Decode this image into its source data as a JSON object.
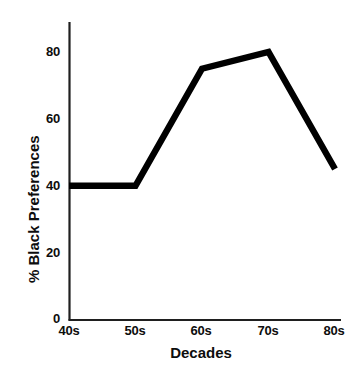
{
  "chart_data": {
    "type": "line",
    "title": "",
    "xlabel": "Decades",
    "ylabel": "% Black Preferences",
    "categories": [
      "40s",
      "50s",
      "60s",
      "70s",
      "80s"
    ],
    "values": [
      40,
      40,
      75,
      80,
      45
    ],
    "series": [
      {
        "name": "% Black Preferences",
        "values": [
          40,
          40,
          75,
          80,
          45
        ]
      }
    ],
    "ylim": [
      0,
      90
    ],
    "yticks": [
      0,
      20,
      40,
      60,
      80
    ],
    "ytick_labels": [
      "0",
      "20",
      "40",
      "60",
      "80"
    ],
    "xtick_labels": [
      "40s",
      "50s",
      "60s",
      "70s",
      "80s"
    ],
    "grid": false,
    "legend": false,
    "legend_position": "none",
    "line_color": "#000000",
    "background_color": "#ffffff",
    "axis_color": "#1a1a1a"
  },
  "axes": {
    "y_label": "% Black Preferences",
    "x_label": "Decades",
    "y_ticks": [
      "80",
      "60",
      "40",
      "20",
      "0"
    ],
    "x_ticks": [
      "40s",
      "50s",
      "60s",
      "70s",
      "80s"
    ]
  }
}
